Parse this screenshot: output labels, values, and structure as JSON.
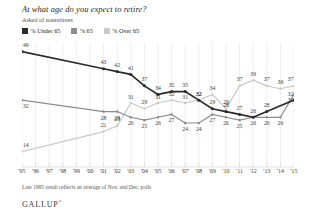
{
  "header": {
    "title": "At what age do you expect to retire?",
    "subtitle": "Asked of nonretirees"
  },
  "legend": {
    "items": [
      {
        "label": "% Under 65",
        "color": "#2b2b2b",
        "name": "legend-under-65"
      },
      {
        "label": "% 65",
        "color": "#8c8c8c",
        "name": "legend-65"
      },
      {
        "label": "% Over 65",
        "color": "#c9c9c9",
        "name": "legend-over-65"
      }
    ]
  },
  "footnote": "Late 1995 result reflects an average of Nov. and Dec. polls",
  "logo": {
    "text": "GALLUP",
    "mark": "®"
  },
  "chart_data": {
    "type": "line",
    "title": "At what age do you expect to retire?",
    "subtitle": "Asked of nonretirees",
    "xlabel": "",
    "ylabel": "",
    "ylim": [
      10,
      52
    ],
    "grid": "vertical",
    "legend_position": "top-left",
    "categories": [
      "'95",
      "'96",
      "'97",
      "'98",
      "'99",
      "'00",
      "'01",
      "'02",
      "'03",
      "'04",
      "'05",
      "'06",
      "'07",
      "'08",
      "'09",
      "'10",
      "'11",
      "'12",
      "'13",
      "'14",
      "'15"
    ],
    "series": [
      {
        "name": "% Under 65",
        "color": "#2b2b2b",
        "values": [
          49,
          null,
          null,
          null,
          null,
          null,
          43,
          42,
          41,
          37,
          34,
          35,
          35,
          32,
          29,
          28,
          27,
          26,
          28,
          null,
          32
        ],
        "labels": [
          "49",
          null,
          null,
          null,
          null,
          null,
          "43",
          "42",
          "41",
          "37",
          "34",
          "35",
          "35",
          "32",
          "29",
          "28",
          "27",
          "26",
          "28",
          null,
          "32"
        ]
      },
      {
        "name": "% 65",
        "color": "#8c8c8c",
        "values": [
          32,
          null,
          null,
          null,
          null,
          null,
          28,
          28,
          26,
          25,
          26,
          27,
          24,
          24,
          27,
          26,
          25,
          26,
          26,
          26,
          34
        ],
        "labels": [
          "32",
          null,
          null,
          null,
          null,
          null,
          "28",
          "28",
          "26",
          "25",
          "26",
          "27",
          "24",
          "24",
          "27",
          "26",
          "25",
          "26",
          "26",
          "26",
          "34"
        ]
      },
      {
        "name": "% Over 65",
        "color": "#c9c9c9",
        "values": [
          14,
          null,
          null,
          null,
          null,
          null,
          21,
          23,
          31,
          29,
          31,
          32,
          31,
          32,
          34,
          29,
          37,
          39,
          37,
          36,
          37
        ],
        "labels": [
          "14",
          null,
          null,
          null,
          null,
          null,
          "21",
          "23",
          "31",
          "29",
          "31",
          "32",
          "31",
          "32",
          "34",
          "29",
          "37",
          "39",
          "37",
          "36",
          "37"
        ]
      }
    ]
  }
}
